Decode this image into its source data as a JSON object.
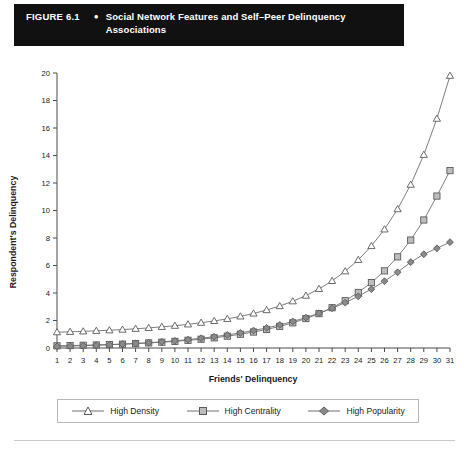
{
  "figure": {
    "label": "FIGURE 6.1",
    "bullet": "●",
    "title": "Social Network Features and Self–Peer Delinquency Associations"
  },
  "colors": {
    "title_bar_bg": "#111111",
    "title_bar_text": "#ffffff",
    "axis": "#4a4a4a",
    "line": "#6e6e6e",
    "density_fill": "#ffffff",
    "centrality_fill": "#bdbdbd",
    "popularity_fill": "#8a8a8a",
    "marker_stroke": "#5a5a5a",
    "legend_border": "#b8b8b8",
    "footer_rule": "#c9c9c9"
  },
  "legend": {
    "position": "bottom",
    "items": [
      {
        "label": "High Density",
        "marker": "triangle-up-marker"
      },
      {
        "label": "High Centrality",
        "marker": "square-marker"
      },
      {
        "label": "High Popularity",
        "marker": "diamond-marker"
      }
    ]
  },
  "chart_data": {
    "type": "line",
    "title": "Social Network Features and Self–Peer Delinquency Associations",
    "xlabel": "Friends' Delinquency",
    "ylabel": "Respondent's Delinquency",
    "xlim": [
      1,
      31
    ],
    "ylim": [
      0,
      20
    ],
    "xticks": [
      1,
      2,
      3,
      4,
      5,
      6,
      7,
      8,
      9,
      10,
      11,
      12,
      13,
      14,
      15,
      16,
      17,
      18,
      19,
      20,
      21,
      22,
      23,
      24,
      25,
      26,
      27,
      28,
      29,
      30,
      31
    ],
    "yticks": [
      0,
      2,
      4,
      6,
      8,
      10,
      12,
      14,
      16,
      18,
      20
    ],
    "grid": false,
    "x": [
      1,
      2,
      3,
      4,
      5,
      6,
      7,
      8,
      9,
      10,
      11,
      12,
      13,
      14,
      15,
      16,
      17,
      18,
      19,
      20,
      21,
      22,
      23,
      24,
      25,
      26,
      27,
      28,
      29,
      30,
      31
    ],
    "series": [
      {
        "name": "High Density",
        "marker": "triangle-up-marker",
        "values": [
          1.15,
          1.18,
          1.21,
          1.25,
          1.29,
          1.34,
          1.4,
          1.46,
          1.54,
          1.62,
          1.72,
          1.84,
          1.97,
          2.12,
          2.3,
          2.51,
          2.76,
          3.05,
          3.4,
          3.81,
          4.3,
          4.88,
          5.58,
          6.41,
          7.42,
          8.63,
          10.1,
          11.88,
          14.05,
          16.68,
          19.8
        ]
      },
      {
        "name": "High Centrality",
        "marker": "square-marker",
        "values": [
          0.16,
          0.18,
          0.2,
          0.22,
          0.25,
          0.28,
          0.32,
          0.37,
          0.42,
          0.48,
          0.56,
          0.64,
          0.74,
          0.86,
          1.0,
          1.16,
          1.35,
          1.57,
          1.83,
          2.14,
          2.5,
          2.93,
          3.44,
          4.04,
          4.76,
          5.61,
          6.63,
          7.85,
          9.31,
          11.05,
          12.9
        ]
      },
      {
        "name": "High Popularity",
        "marker": "diamond-marker",
        "values": [
          0.12,
          0.14,
          0.17,
          0.2,
          0.24,
          0.28,
          0.33,
          0.38,
          0.45,
          0.52,
          0.61,
          0.71,
          0.82,
          0.95,
          1.1,
          1.27,
          1.46,
          1.68,
          1.93,
          2.21,
          2.53,
          2.89,
          3.3,
          3.76,
          4.28,
          4.86,
          5.51,
          6.24,
          6.82,
          7.25,
          7.7
        ]
      }
    ]
  }
}
